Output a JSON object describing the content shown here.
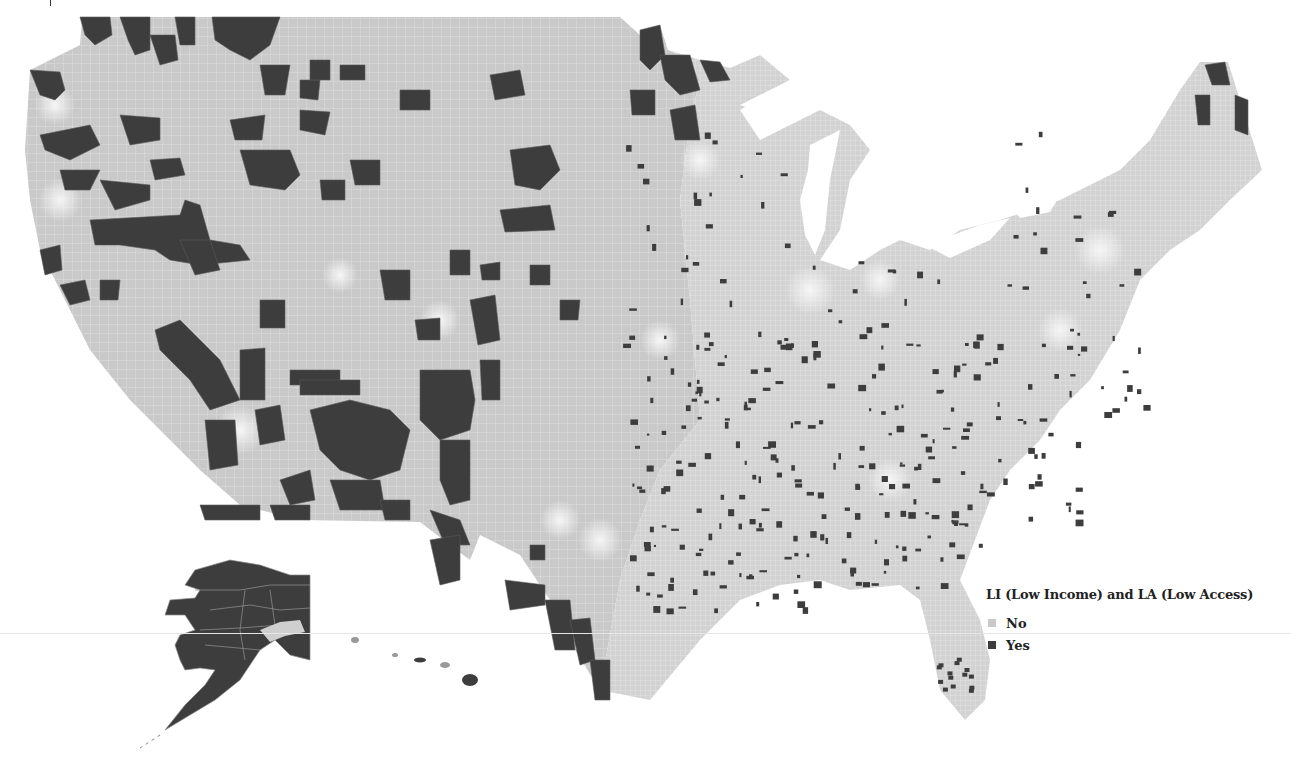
{
  "legend": {
    "title": "LI (Low Income) and LA (Low Access)",
    "items": [
      {
        "label": "No",
        "color": "#c9c9c9",
        "icon": "square-swatch-icon"
      },
      {
        "label": "Yes",
        "color": "#3d3d3d",
        "icon": "square-swatch-icon"
      }
    ]
  },
  "colors": {
    "no": "#c9c9c9",
    "yes": "#3d3d3d",
    "tract_lines": "#e4e4e4",
    "urban_light": "#ececec",
    "background": "#ffffff"
  },
  "regions": {
    "contiguous_us": "Contiguous United States",
    "alaska": "Alaska",
    "hawaii": "Hawaii"
  }
}
